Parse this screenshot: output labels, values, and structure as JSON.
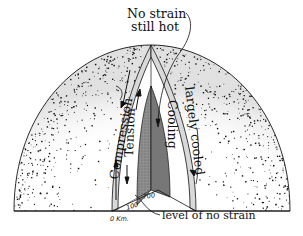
{
  "figure": {
    "type": "cutaway hemisphere diagram"
  },
  "labels": {
    "top_line1": "No strain",
    "top_line2": "still hot",
    "compression": "Compression",
    "tension": "Tension",
    "cooling": "Cooling",
    "largely_cooled": "largely cooled",
    "level_of_no_strain": "level of no strain"
  },
  "depth_ticks": {
    "surface": "0 Km.",
    "mid": "100",
    "deep": "700"
  },
  "colors": {
    "ink": "#111111",
    "shell_band": "#d9d9d9",
    "core_shade": "#8a8a8a",
    "core_shade_dark": "#6e6e6e",
    "background": "#ffffff"
  }
}
